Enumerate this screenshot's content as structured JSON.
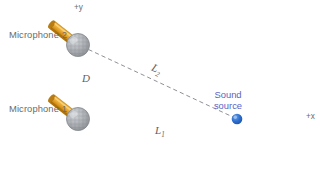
{
  "figure": {
    "type": "physics-schematic"
  },
  "axes": {
    "y_label": "+y",
    "x_label": "+x",
    "origin_note": "Microphone 1 at origin"
  },
  "labels": {
    "microphone_2": "Microphone 2",
    "microphone_1": "Microphone 1",
    "separation": "D",
    "distance_1": "L",
    "distance_1_sub": "1",
    "distance_2": "L",
    "distance_2_sub": "2",
    "source_line1": "Sound",
    "source_line2": "source"
  },
  "colors": {
    "axis_grey": "#8a8f94",
    "axis_pink": "#f0a0a8",
    "axis_green": "#8fbf9a",
    "mic_head": "#b0b3b6",
    "mic_head_dark": "#8d9093",
    "mic_handle": "#e5a42b",
    "mic_handle_dark": "#b97c16",
    "source_dot": "#2f6fd0",
    "source_text": "#5b63c4",
    "dashed_line": "#7a7a86",
    "label_text": "#6b6b6b"
  },
  "geometry": {
    "origin_x": 78,
    "origin_y": 119,
    "mic2_x": 78,
    "mic2_y": 45,
    "source_x": 237,
    "source_y": 119,
    "x_axis_start": 22,
    "x_axis_end": 303,
    "y_axis_top": 18,
    "y_axis_bottom": 172
  }
}
